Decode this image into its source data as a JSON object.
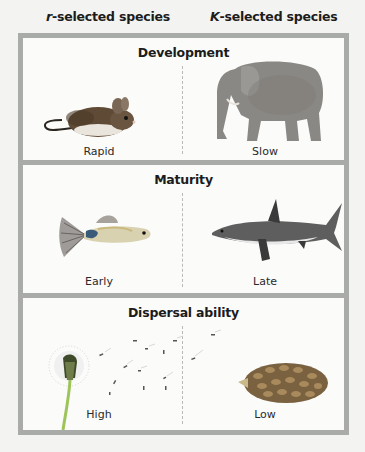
{
  "headers": {
    "r_prefix": "r",
    "r_suffix": "-selected species",
    "k_prefix": "K",
    "k_suffix": "-selected species"
  },
  "panels": [
    {
      "title": "Development",
      "left": {
        "label": "Rapid",
        "image": "mouse"
      },
      "right": {
        "label": "Slow",
        "image": "elephant"
      }
    },
    {
      "title": "Maturity",
      "left": {
        "label": "Early",
        "image": "guppy"
      },
      "right": {
        "label": "Late",
        "image": "shark"
      }
    },
    {
      "title": "Dispersal ability",
      "left": {
        "label": "High",
        "image": "dandelion"
      },
      "right": {
        "label": "Low",
        "image": "pine-cone"
      }
    }
  ],
  "colors": {
    "frame": "#a9aba9",
    "panel_bg": "#fbfbfa",
    "page_bg": "#f3f3f1"
  }
}
